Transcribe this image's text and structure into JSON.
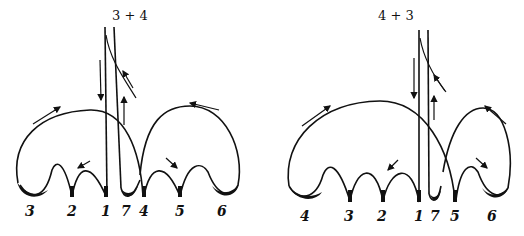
{
  "diagrams": [
    {
      "title": "3 + 4",
      "labels": [
        "3",
        "2",
        "1",
        "7",
        "4",
        "5",
        "6"
      ]
    },
    {
      "title": "4 + 3",
      "labels": [
        "4",
        "3",
        "2",
        "1",
        "7",
        "5",
        "6"
      ]
    }
  ],
  "colors": {
    "ink": "#111111",
    "background": "#ffffff"
  }
}
